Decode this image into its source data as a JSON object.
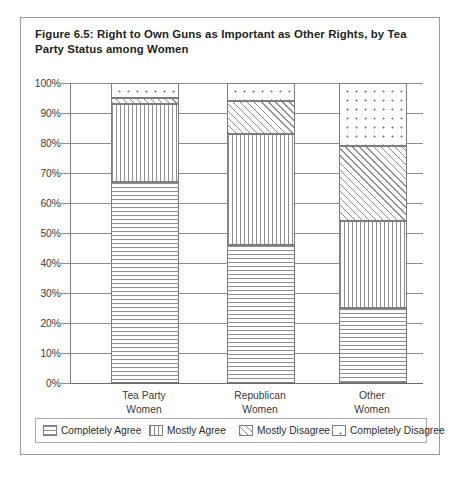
{
  "figure": {
    "title": "Figure 6.5: Right to Own Guns as Important as Other Rights, by Tea Party Status among Women"
  },
  "chart_data": {
    "type": "bar",
    "subtype": "stacked-percent-column",
    "title": "Figure 6.5: Right to Own Guns as Important as Other Rights, by Tea Party Status among Women",
    "xlabel": "",
    "ylabel": "",
    "ylim": [
      0,
      100
    ],
    "ytick_labels": [
      "0%",
      "10%",
      "20%",
      "30%",
      "40%",
      "50%",
      "60%",
      "70%",
      "80%",
      "90%",
      "100%"
    ],
    "ytick_values": [
      0,
      10,
      20,
      30,
      40,
      50,
      60,
      70,
      80,
      90,
      100
    ],
    "grid": true,
    "legend_position": "bottom",
    "categories": [
      "Tea Party Women",
      "Republican Women",
      "Other Women"
    ],
    "category_lines": [
      [
        "Tea Party",
        "Women"
      ],
      [
        "Republican",
        "Women"
      ],
      [
        "Other",
        "Women"
      ]
    ],
    "series": [
      {
        "name": "Completely Agree",
        "pattern": "horizontal-lines",
        "values": [
          67,
          46,
          25
        ]
      },
      {
        "name": "Mostly Agree",
        "pattern": "vertical-lines",
        "values": [
          26,
          37,
          29
        ]
      },
      {
        "name": "Mostly Disagree",
        "pattern": "diagonal-hatch",
        "values": [
          2,
          11,
          25
        ]
      },
      {
        "name": "Completely Disagree",
        "pattern": "dots",
        "values": [
          5,
          6,
          21
        ]
      }
    ]
  },
  "legend": {
    "items": [
      {
        "label": "Completely Agree",
        "pattern": "horizontal-lines"
      },
      {
        "label": "Mostly Agree",
        "pattern": "vertical-lines"
      },
      {
        "label": "Mostly Disagree",
        "pattern": "diagonal-hatch"
      },
      {
        "label": "Completely Disagree",
        "pattern": "dots"
      }
    ]
  },
  "colors": {
    "frame": "#9a9a9a",
    "gridline": "#8c8c8c",
    "text": "#2c2c2c",
    "pattern_ink": "#8e8e8e",
    "background": "#ffffff"
  }
}
